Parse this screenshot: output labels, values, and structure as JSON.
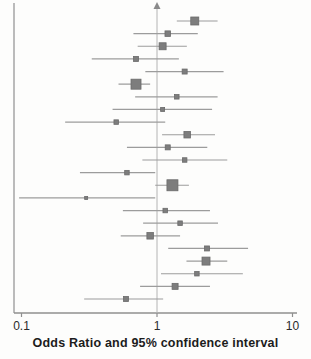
{
  "chart_data": {
    "type": "forest",
    "title": "",
    "xlabel": "Odds Ratio and 95% confidence interval",
    "xscale": "log",
    "xlim": [
      0.1,
      10
    ],
    "x_ticks": [
      0.1,
      1,
      10
    ],
    "x_tick_labels": [
      "0.1",
      "1",
      "10"
    ],
    "ref_line": 1,
    "grid": false,
    "legend": "none",
    "studies": [
      {
        "or": 1.9,
        "ci_low": 1.4,
        "ci_high": 2.8,
        "marker_px": 8
      },
      {
        "or": 1.2,
        "ci_low": 0.67,
        "ci_high": 2.0,
        "marker_px": 5.5
      },
      {
        "or": 1.1,
        "ci_low": 0.72,
        "ci_high": 1.66,
        "marker_px": 7
      },
      {
        "or": 0.7,
        "ci_low": 0.33,
        "ci_high": 1.45,
        "marker_px": 5
      },
      {
        "or": 1.6,
        "ci_low": 0.82,
        "ci_high": 3.1,
        "marker_px": 5
      },
      {
        "or": 0.7,
        "ci_low": 0.52,
        "ci_high": 0.89,
        "marker_px": 10
      },
      {
        "or": 1.4,
        "ci_low": 0.69,
        "ci_high": 2.8,
        "marker_px": 4.5
      },
      {
        "or": 1.1,
        "ci_low": 0.47,
        "ci_high": 2.55,
        "marker_px": 4
      },
      {
        "or": 0.5,
        "ci_low": 0.21,
        "ci_high": 1.15,
        "marker_px": 4.5
      },
      {
        "or": 1.67,
        "ci_low": 1.09,
        "ci_high": 2.68,
        "marker_px": 6.5
      },
      {
        "or": 1.2,
        "ci_low": 0.6,
        "ci_high": 2.35,
        "marker_px": 5
      },
      {
        "or": 1.6,
        "ci_low": 0.78,
        "ci_high": 3.3,
        "marker_px": 4.5
      },
      {
        "or": 0.6,
        "ci_low": 0.27,
        "ci_high": 0.97,
        "marker_px": 4.5
      },
      {
        "or": 1.3,
        "ci_low": 0.97,
        "ci_high": 1.72,
        "marker_px": 11
      },
      {
        "or": 0.3,
        "ci_low": 0.096,
        "ci_high": 0.97,
        "marker_px": 3
      },
      {
        "or": 1.15,
        "ci_low": 0.56,
        "ci_high": 2.46,
        "marker_px": 4.5
      },
      {
        "or": 1.48,
        "ci_low": 0.79,
        "ci_high": 2.82,
        "marker_px": 4.5
      },
      {
        "or": 0.89,
        "ci_low": 0.54,
        "ci_high": 1.48,
        "marker_px": 6.5
      },
      {
        "or": 2.34,
        "ci_low": 1.21,
        "ci_high": 4.7,
        "marker_px": 5
      },
      {
        "or": 2.3,
        "ci_low": 1.65,
        "ci_high": 3.3,
        "marker_px": 8
      },
      {
        "or": 1.97,
        "ci_low": 1.07,
        "ci_high": 4.3,
        "marker_px": 4.5
      },
      {
        "or": 1.36,
        "ci_low": 0.75,
        "ci_high": 2.46,
        "marker_px": 6
      },
      {
        "or": 0.59,
        "ci_low": 0.29,
        "ci_high": 1.11,
        "marker_px": 5
      }
    ]
  },
  "colors": {
    "marker_fill": "#7d7d7d",
    "marker_stroke": "#6a6a6a",
    "ci_line": "#9c9c9c",
    "ref_line": "#b4b4b4",
    "axis_line": "#8f8f8f",
    "arrow": "#8a8a8a",
    "tick_text": "#2b2b2b",
    "background": "#fdfdfc"
  }
}
